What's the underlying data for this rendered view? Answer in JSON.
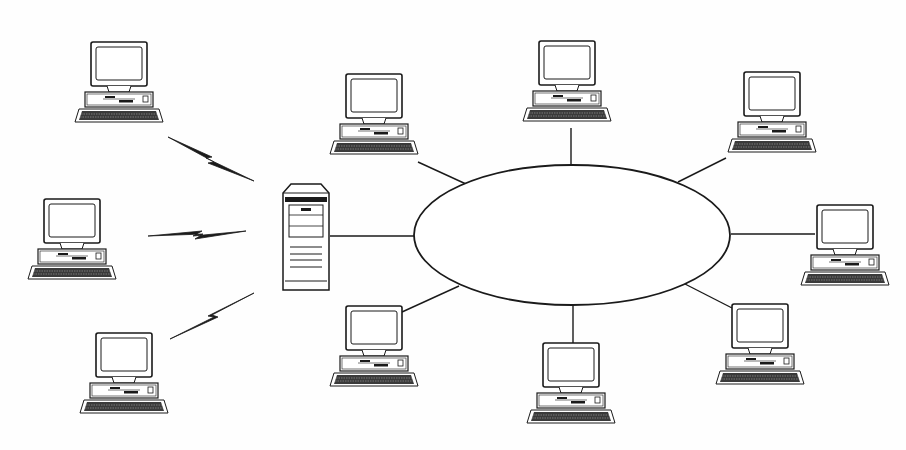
{
  "diagram": {
    "title": "",
    "type": "network-topology",
    "colors": {
      "stroke": "#1a1a1a",
      "background": "#fefefe",
      "fill": "#ffffff",
      "keyboard": "#3a3a3a"
    },
    "nodes": [
      {
        "id": "wireless-client-1",
        "kind": "workstation",
        "group": "wireless"
      },
      {
        "id": "wireless-client-2",
        "kind": "workstation",
        "group": "wireless"
      },
      {
        "id": "wireless-client-3",
        "kind": "workstation",
        "group": "wireless"
      },
      {
        "id": "server",
        "kind": "tower-server",
        "group": "hub"
      },
      {
        "id": "lan-ring",
        "kind": "network-ring",
        "group": "lan"
      },
      {
        "id": "lan-ws-top-left",
        "kind": "workstation",
        "group": "lan"
      },
      {
        "id": "lan-ws-top",
        "kind": "workstation",
        "group": "lan"
      },
      {
        "id": "lan-ws-top-right",
        "kind": "workstation",
        "group": "lan"
      },
      {
        "id": "lan-ws-right",
        "kind": "workstation",
        "group": "lan"
      },
      {
        "id": "lan-ws-bottom-right",
        "kind": "workstation",
        "group": "lan"
      },
      {
        "id": "lan-ws-bottom",
        "kind": "workstation",
        "group": "lan"
      },
      {
        "id": "lan-ws-bottom-left",
        "kind": "workstation",
        "group": "lan"
      }
    ],
    "links": [
      {
        "from": "wireless-client-1",
        "to": "server",
        "type": "wireless"
      },
      {
        "from": "wireless-client-2",
        "to": "server",
        "type": "wireless"
      },
      {
        "from": "wireless-client-3",
        "to": "server",
        "type": "wireless"
      },
      {
        "from": "server",
        "to": "lan-ring",
        "type": "wired"
      },
      {
        "from": "lan-ws-top-left",
        "to": "lan-ring",
        "type": "wired"
      },
      {
        "from": "lan-ws-top",
        "to": "lan-ring",
        "type": "wired"
      },
      {
        "from": "lan-ws-top-right",
        "to": "lan-ring",
        "type": "wired"
      },
      {
        "from": "lan-ws-right",
        "to": "lan-ring",
        "type": "wired"
      },
      {
        "from": "lan-ws-bottom-right",
        "to": "lan-ring",
        "type": "wired"
      },
      {
        "from": "lan-ws-bottom",
        "to": "lan-ring",
        "type": "wired"
      },
      {
        "from": "lan-ws-bottom-left",
        "to": "lan-ring",
        "type": "wired"
      }
    ]
  }
}
